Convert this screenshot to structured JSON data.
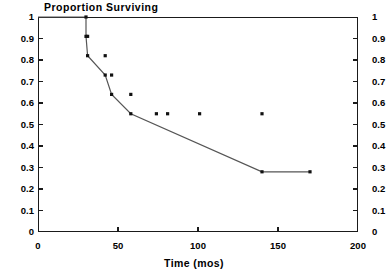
{
  "chart_data": {
    "type": "line",
    "title": "Proportion Surviving",
    "xlabel": "Time (mos)",
    "ylabel": "",
    "xlim": [
      0,
      200
    ],
    "ylim": [
      0,
      1
    ],
    "grid": false,
    "legend": "none",
    "curve_style": "kaplan-meier step function",
    "xticks": [
      0,
      50,
      100,
      150,
      200
    ],
    "xtick_labels": [
      "0",
      "50",
      "100",
      "150",
      "200"
    ],
    "yticks": [
      0,
      0.1,
      0.2,
      0.3,
      0.4,
      0.5,
      0.6,
      0.7,
      0.8,
      0.9,
      1
    ],
    "ytick_labels": [
      "0",
      "0.1",
      "0.2",
      "0.3",
      "0.4",
      "0.5",
      "0.6",
      "0.7",
      "0.8",
      "0.9",
      "1"
    ],
    "ytick_labels_right": [
      "0",
      "0.1",
      "0.2",
      "0.3",
      "0.4",
      "0.5",
      "0.6",
      "0.7",
      "0.8",
      "0.9",
      "1"
    ],
    "series": [
      {
        "name": "survival",
        "x": [
          0,
          30,
          30,
          31,
          42,
          46,
          58,
          140,
          170
        ],
        "y": [
          1.0,
          1.0,
          0.91,
          0.82,
          0.73,
          0.64,
          0.55,
          0.28,
          0.28
        ],
        "steps": [
          {
            "time": 0,
            "survival": 1.0
          },
          {
            "time": 30,
            "survival": 0.91
          },
          {
            "time": 31,
            "survival": 0.82
          },
          {
            "time": 42,
            "survival": 0.73
          },
          {
            "time": 46,
            "survival": 0.64
          },
          {
            "time": 58,
            "survival": 0.55
          },
          {
            "time": 140,
            "survival": 0.28
          },
          {
            "time": 170,
            "survival": 0.28
          }
        ],
        "censored": [
          {
            "time": 74,
            "survival": 0.55
          },
          {
            "time": 81,
            "survival": 0.55
          },
          {
            "time": 101,
            "survival": 0.55
          },
          {
            "time": 170,
            "survival": 0.28
          }
        ],
        "event_markers": [
          {
            "time": 30,
            "survival": 1.0
          },
          {
            "time": 30,
            "survival": 0.91
          },
          {
            "time": 31,
            "survival": 0.91
          },
          {
            "time": 31,
            "survival": 0.82
          },
          {
            "time": 42,
            "survival": 0.82
          },
          {
            "time": 42,
            "survival": 0.73
          },
          {
            "time": 46,
            "survival": 0.73
          },
          {
            "time": 46,
            "survival": 0.64
          },
          {
            "time": 58,
            "survival": 0.64
          },
          {
            "time": 58,
            "survival": 0.55
          },
          {
            "time": 140,
            "survival": 0.55
          },
          {
            "time": 140,
            "survival": 0.28
          }
        ]
      }
    ]
  },
  "colors": {
    "axis": "#1a1a1a",
    "curve": "#555555",
    "marker": "#111111",
    "background": "#ffffff"
  }
}
